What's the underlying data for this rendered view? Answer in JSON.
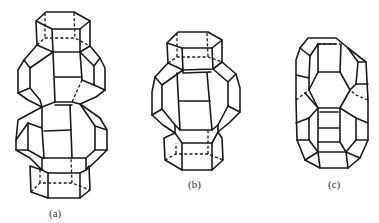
{
  "figure": {
    "panels": [
      {
        "id": "a",
        "label": "(a)",
        "description": "elongated cage with hexagonal prisms at top and bottom, two stacked cages"
      },
      {
        "id": "b",
        "label": "(b)",
        "description": "single cage capped by hexagonal prisms top and bottom"
      },
      {
        "id": "c",
        "label": "(c)",
        "description": "elongated cage without hexagonal prism caps"
      }
    ],
    "colors": {
      "line": "#1a1a1a",
      "background": "#ffffff",
      "label": "#333333"
    }
  }
}
